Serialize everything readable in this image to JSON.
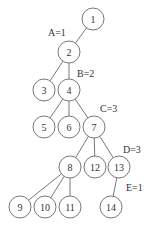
{
  "diagram": {
    "type": "tree",
    "node_radius": 11,
    "nodes": [
      {
        "id": "1",
        "label": "1",
        "x": 93,
        "y": 19
      },
      {
        "id": "2",
        "label": "2",
        "x": 69,
        "y": 52
      },
      {
        "id": "3",
        "label": "3",
        "x": 44,
        "y": 90
      },
      {
        "id": "4",
        "label": "4",
        "x": 69,
        "y": 90
      },
      {
        "id": "5",
        "label": "5",
        "x": 44,
        "y": 127
      },
      {
        "id": "6",
        "label": "6",
        "x": 69,
        "y": 127
      },
      {
        "id": "7",
        "label": "7",
        "x": 94,
        "y": 127
      },
      {
        "id": "8",
        "label": "8",
        "x": 70,
        "y": 167
      },
      {
        "id": "12",
        "label": "12",
        "x": 95,
        "y": 167
      },
      {
        "id": "13",
        "label": "13",
        "x": 119,
        "y": 167
      },
      {
        "id": "9",
        "label": "9",
        "x": 20,
        "y": 207
      },
      {
        "id": "10",
        "label": "10",
        "x": 45,
        "y": 207
      },
      {
        "id": "11",
        "label": "11",
        "x": 70,
        "y": 207
      },
      {
        "id": "14",
        "label": "14",
        "x": 111,
        "y": 207
      }
    ],
    "edges": [
      {
        "from": "1",
        "to": "2"
      },
      {
        "from": "2",
        "to": "3"
      },
      {
        "from": "2",
        "to": "4"
      },
      {
        "from": "4",
        "to": "5"
      },
      {
        "from": "4",
        "to": "6"
      },
      {
        "from": "4",
        "to": "7"
      },
      {
        "from": "7",
        "to": "8"
      },
      {
        "from": "7",
        "to": "12"
      },
      {
        "from": "7",
        "to": "13"
      },
      {
        "from": "8",
        "to": "9"
      },
      {
        "from": "8",
        "to": "10"
      },
      {
        "from": "8",
        "to": "11"
      },
      {
        "from": "13",
        "to": "14"
      }
    ],
    "edge_labels": [
      {
        "text": "A=1",
        "x": 48,
        "y": 36
      },
      {
        "text": "B=2",
        "x": 77,
        "y": 77
      },
      {
        "text": "C=3",
        "x": 100,
        "y": 112
      },
      {
        "text": "D=3",
        "x": 123,
        "y": 153
      },
      {
        "text": "E=1",
        "x": 126,
        "y": 191
      }
    ]
  }
}
